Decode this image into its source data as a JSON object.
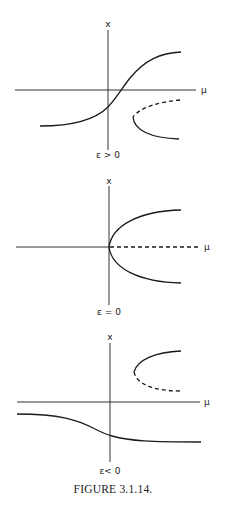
{
  "figure": {
    "caption": "FIGURE 3.1.14.",
    "panels": [
      {
        "id": "eps-positive",
        "y_axis_label": "x",
        "x_axis_label": "μ",
        "condition_label": "ε > 0",
        "branches": [
          {
            "name": "stable-sigmoid",
            "style": "solid"
          },
          {
            "name": "unstable-fold-upper",
            "style": "dashed"
          },
          {
            "name": "stable-fold-lower",
            "style": "solid"
          }
        ]
      },
      {
        "id": "eps-zero",
        "y_axis_label": "x",
        "x_axis_label": "μ",
        "condition_label": "ε = 0",
        "branches": [
          {
            "name": "stable-trivial-left",
            "style": "solid"
          },
          {
            "name": "unstable-trivial-right",
            "style": "dashed"
          },
          {
            "name": "stable-pitchfork-upper",
            "style": "solid"
          },
          {
            "name": "stable-pitchfork-lower",
            "style": "solid"
          }
        ]
      },
      {
        "id": "eps-negative",
        "y_axis_label": "x",
        "x_axis_label": "μ",
        "condition_label": "ε< 0",
        "branches": [
          {
            "name": "stable-fold-upper",
            "style": "solid"
          },
          {
            "name": "unstable-fold-lower",
            "style": "dashed"
          },
          {
            "name": "stable-sigmoid-decreasing",
            "style": "solid"
          }
        ]
      }
    ]
  },
  "colors": {
    "background": "#ffffff",
    "ink": "#1a1a1a"
  }
}
